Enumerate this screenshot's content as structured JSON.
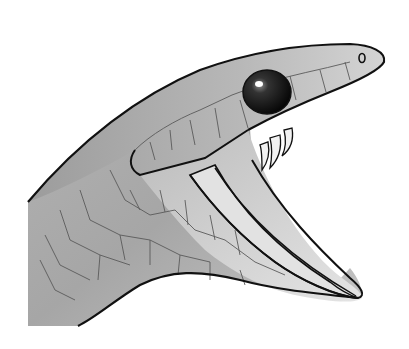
{
  "image": {
    "subject": "snake head with open mouth",
    "style": "grayscale illustration",
    "background": "#ffffff",
    "colors": {
      "outline": "#111111",
      "body_light": "#c8c8c8",
      "body_mid": "#a8a8a8",
      "body_dark": "#8c8c8c",
      "mouth_inner": "#dcdcdc",
      "eye": "#1a1a1a",
      "eye_highlight": "#ffffff",
      "scale_lines": "#555555"
    }
  }
}
